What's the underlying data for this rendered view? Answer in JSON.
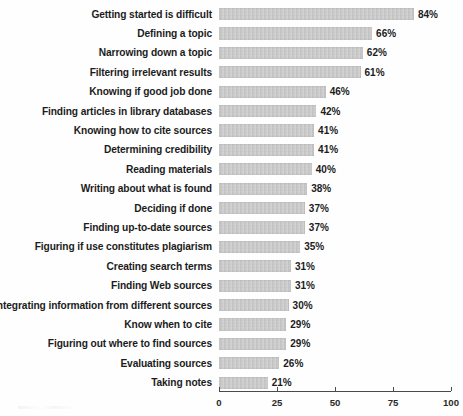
{
  "chart_data": {
    "type": "bar",
    "orientation": "horizontal",
    "title": "",
    "subtitle": "",
    "xlabel": "",
    "ylabel": "",
    "xlim": [
      0,
      100
    ],
    "grid": false,
    "legend": null,
    "value_suffix": "%",
    "tick_labels": [
      "0",
      "25",
      "50",
      "75",
      "100"
    ],
    "ticks": [
      0,
      25,
      50,
      75,
      100
    ],
    "categories": [
      "Getting started is difficult",
      "Defining a topic",
      "Narrowing down a topic",
      "Filtering irrelevant results",
      "Knowing if good job done",
      "Finding articles in library databases",
      "Knowing how to cite sources",
      "Determining credibility",
      "Reading materials",
      "Writing about what is found",
      "Deciding if done",
      "Finding up-to-date sources",
      "Figuring if use constitutes plagiarism",
      "Creating search terms",
      "Finding Web sources",
      "Integrating information from different sources",
      "Know when to cite",
      "Figuring out where to find sources",
      "Evaluating sources",
      "Taking notes"
    ],
    "values": [
      84,
      66,
      62,
      61,
      46,
      42,
      41,
      41,
      40,
      38,
      37,
      37,
      35,
      31,
      31,
      30,
      29,
      29,
      26,
      21
    ],
    "value_labels": [
      "84%",
      "66%",
      "62%",
      "61%",
      "46%",
      "42%",
      "41%",
      "41%",
      "40%",
      "38%",
      "37%",
      "37%",
      "35%",
      "31%",
      "31%",
      "30%",
      "29%",
      "29%",
      "26%",
      "21%"
    ],
    "bar_color": "#c9c9c9",
    "axis_color": "#4a4a4a",
    "text_color": "#1c1c1c",
    "background_color": "#fefefe"
  }
}
